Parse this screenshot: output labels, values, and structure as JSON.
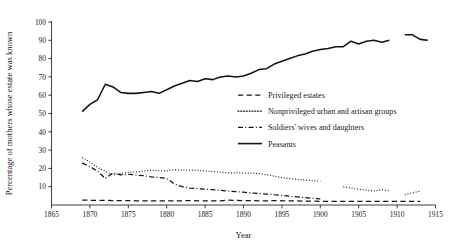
{
  "chart_data": {
    "type": "line",
    "title": "",
    "xlabel": "Year",
    "ylabel": "Percentage of mothers whose estate was known",
    "xlim": [
      1865,
      1915
    ],
    "ylim": [
      0,
      100
    ],
    "xticks": [
      1865,
      1870,
      1875,
      1880,
      1885,
      1890,
      1895,
      1900,
      1905,
      1910,
      1915
    ],
    "yticks": [
      10,
      20,
      30,
      40,
      50,
      60,
      70,
      80,
      90,
      100
    ],
    "grid": false,
    "legend_position": "center-right",
    "series": [
      {
        "name": "Privileged estates",
        "style": "dashed",
        "x": [
          1869,
          1870,
          1871,
          1872,
          1873,
          1874,
          1875,
          1876,
          1877,
          1878,
          1879,
          1880,
          1881,
          1882,
          1883,
          1884,
          1885,
          1886,
          1887,
          1888,
          1889,
          1890,
          1891,
          1892,
          1893,
          1894,
          1895,
          1896,
          1897,
          1898,
          1899,
          1900,
          1901,
          1902,
          1903,
          1904,
          1905,
          1906,
          1907,
          1908,
          1909,
          1910,
          1911,
          1912,
          1913
        ],
        "values": [
          2.6,
          2.6,
          2.5,
          2.5,
          2.4,
          2.4,
          2.4,
          2.3,
          2.3,
          2.3,
          2.3,
          2.3,
          2.2,
          2.3,
          2.4,
          2.3,
          2.2,
          2.2,
          2.3,
          2.6,
          2.5,
          2.4,
          2.4,
          2.3,
          2.3,
          2.4,
          2.3,
          2.2,
          2.2,
          2.1,
          2.1,
          2.0,
          2.0,
          2.0,
          2.0,
          2.0,
          2.0,
          2.0,
          2.0,
          2.0,
          2.0,
          2.0,
          2.0,
          2.0,
          2.0
        ]
      },
      {
        "name": "Nonprivileged urban and artisan groups",
        "style": "dotted",
        "x": [
          1869,
          1870,
          1871,
          1872,
          1873,
          1874,
          1875,
          1876,
          1877,
          1878,
          1879,
          1880,
          1881,
          1882,
          1883,
          1884,
          1885,
          1886,
          1887,
          1888,
          1889,
          1890,
          1891,
          1892,
          1893,
          1894,
          1895,
          1896,
          1897,
          1898,
          1899,
          1900,
          1903,
          1904,
          1905,
          1906,
          1907,
          1908,
          1909,
          1911,
          1912,
          1913
        ],
        "values": [
          26.0,
          23.5,
          20.5,
          18.5,
          16.5,
          17.2,
          17.8,
          18.0,
          18.6,
          19.0,
          18.6,
          18.6,
          19.3,
          19.1,
          19.0,
          19.0,
          18.6,
          18.3,
          18.0,
          17.6,
          17.5,
          17.5,
          17.4,
          17.2,
          16.5,
          15.8,
          15.0,
          14.4,
          14.0,
          13.6,
          13.3,
          13.0,
          10.0,
          9.3,
          8.6,
          8.1,
          7.6,
          8.3,
          7.8,
          5.6,
          6.6,
          7.6
        ]
      },
      {
        "name": "Soldiers' wives and daughters",
        "style": "dashdot",
        "x": [
          1869,
          1870,
          1871,
          1872,
          1873,
          1874,
          1875,
          1876,
          1877,
          1878,
          1879,
          1880,
          1881,
          1882,
          1883,
          1884,
          1885,
          1886,
          1887,
          1888,
          1889,
          1890,
          1891,
          1892,
          1893,
          1894,
          1895,
          1896,
          1897,
          1898,
          1899,
          1900
        ],
        "values": [
          23.0,
          21.0,
          18.5,
          14.5,
          17.5,
          16.5,
          16.8,
          16.4,
          16.0,
          15.4,
          15.0,
          14.5,
          11.5,
          10.0,
          9.2,
          9.0,
          8.6,
          8.4,
          8.0,
          7.6,
          7.3,
          7.0,
          6.6,
          6.3,
          6.0,
          5.6,
          5.2,
          4.8,
          4.4,
          4.0,
          3.6,
          3.4
        ]
      },
      {
        "name": "Peasants",
        "style": "solid",
        "x": [
          1869,
          1870,
          1871,
          1872,
          1873,
          1874,
          1875,
          1876,
          1877,
          1878,
          1879,
          1880,
          1881,
          1882,
          1883,
          1884,
          1885,
          1886,
          1887,
          1888,
          1889,
          1890,
          1891,
          1892,
          1893,
          1894,
          1895,
          1896,
          1897,
          1898,
          1899,
          1900,
          1901,
          1902,
          1903,
          1904,
          1905,
          1906,
          1907,
          1908,
          1909,
          1911,
          1912,
          1913,
          1914
        ],
        "values": [
          51.0,
          55.0,
          57.5,
          66.0,
          64.5,
          61.5,
          61.0,
          61.0,
          61.5,
          62.0,
          61.0,
          63.0,
          65.0,
          66.5,
          68.0,
          67.5,
          69.0,
          68.5,
          70.0,
          70.5,
          70.0,
          70.5,
          72.0,
          74.0,
          74.5,
          77.0,
          78.5,
          80.0,
          81.5,
          82.5,
          84.0,
          85.0,
          85.5,
          86.5,
          86.5,
          89.5,
          88.0,
          89.5,
          90.0,
          89.0,
          90.0,
          93.0,
          93.0,
          90.5,
          90.0
        ]
      }
    ]
  },
  "legend": {
    "items": [
      {
        "label": "Privileged estates",
        "style": "dashed"
      },
      {
        "label": "Nonprivileged urban and artisan groups",
        "style": "dotted"
      },
      {
        "label": "Soldiers' wives and daughters",
        "style": "dashdot"
      },
      {
        "label": "Peasants",
        "style": "solid"
      }
    ]
  }
}
